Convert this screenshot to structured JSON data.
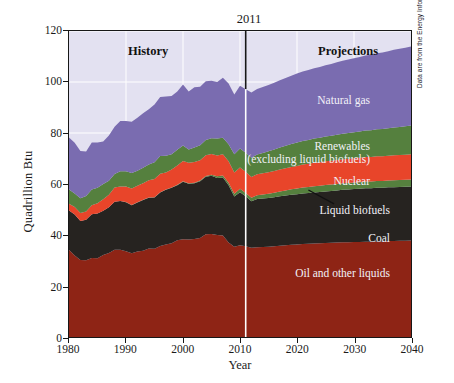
{
  "figure": {
    "background_color": "#ffffff",
    "plot_background_color": "#e3e1f1",
    "gridline_color": "#ffffff",
    "frame_color": "#171717",
    "attribution": "Data are from the Energy Information Administration's Annual Energy Outlook, 2009."
  },
  "axes": {
    "y_title": "Quadrillion Btu",
    "x_title": "Year",
    "y_ticks": [
      0,
      20,
      40,
      60,
      80,
      100,
      120
    ],
    "x_ticks": [
      1980,
      1990,
      2000,
      2010,
      2020,
      2030,
      2040
    ]
  },
  "annotations": {
    "divider_year": "2011",
    "history_label": "History",
    "projections_label": "Projections"
  },
  "chart_data": {
    "type": "area",
    "title": "",
    "subtitle": "",
    "xlabel": "Year",
    "ylabel": "Quadrillion Btu",
    "xlim": [
      1980,
      2040
    ],
    "ylim": [
      0,
      120
    ],
    "grid": true,
    "stacked": true,
    "legend_position": "in-plot labels",
    "divider_x": 2011,
    "annotations": [
      {
        "text": "2011",
        "x": 2011,
        "position": "above-plot"
      },
      {
        "text": "History",
        "x": 1993,
        "y": 112,
        "style": "bold"
      },
      {
        "text": "Projections",
        "x": 2029,
        "y": 112,
        "style": "bold"
      }
    ],
    "x": [
      1980,
      1981,
      1982,
      1983,
      1984,
      1985,
      1986,
      1987,
      1988,
      1989,
      1990,
      1991,
      1992,
      1993,
      1994,
      1995,
      1996,
      1997,
      1998,
      1999,
      2000,
      2001,
      2002,
      2003,
      2004,
      2005,
      2006,
      2007,
      2008,
      2009,
      2010,
      2011,
      2012,
      2013,
      2014,
      2015,
      2016,
      2017,
      2018,
      2019,
      2020,
      2021,
      2022,
      2023,
      2024,
      2025,
      2026,
      2027,
      2028,
      2029,
      2030,
      2031,
      2032,
      2033,
      2034,
      2035,
      2036,
      2037,
      2038,
      2039,
      2040
    ],
    "series": [
      {
        "name": "Oil and other liquids",
        "color": "#8e2415",
        "label_color": "#f2f1f8",
        "values": [
          34.2,
          32.0,
          30.2,
          30.1,
          31.0,
          30.9,
          32.2,
          32.9,
          34.2,
          34.2,
          33.6,
          32.8,
          33.5,
          33.8,
          34.7,
          34.6,
          35.7,
          36.3,
          36.8,
          37.9,
          38.3,
          38.2,
          38.4,
          38.8,
          40.3,
          40.4,
          40.0,
          39.8,
          37.1,
          35.4,
          36.0,
          35.6,
          35.0,
          35.2,
          35.3,
          35.4,
          35.6,
          35.8,
          36.0,
          36.2,
          36.3,
          36.5,
          36.6,
          36.7,
          36.8,
          36.9,
          37.0,
          37.1,
          37.2,
          37.2,
          37.3,
          37.3,
          37.4,
          37.4,
          37.5,
          37.5,
          37.6,
          37.6,
          37.7,
          37.7,
          37.8
        ]
      },
      {
        "name": "Coal",
        "color": "#262320",
        "label_color": "#f2f1f8",
        "values": [
          15.4,
          16.0,
          15.3,
          15.9,
          17.1,
          17.5,
          17.3,
          18.0,
          18.8,
          19.1,
          19.2,
          18.9,
          19.2,
          19.9,
          19.9,
          20.1,
          21.0,
          21.4,
          21.7,
          21.6,
          22.6,
          21.9,
          21.9,
          22.3,
          22.5,
          22.8,
          22.4,
          22.7,
          22.4,
          19.7,
          20.8,
          19.6,
          18.2,
          18.9,
          19.0,
          19.1,
          19.2,
          19.4,
          19.5,
          19.6,
          19.7,
          19.8,
          19.9,
          20.0,
          20.1,
          20.2,
          20.3,
          20.4,
          20.5,
          20.6,
          20.7,
          20.8,
          20.9,
          20.9,
          21.0,
          21.0,
          21.1,
          21.1,
          21.1,
          21.2,
          21.2
        ]
      },
      {
        "name": "Liquid biofuels",
        "color": "#55803e",
        "label_color": "#f2f1f8",
        "values": [
          0.0,
          0.0,
          0.0,
          0.0,
          0.0,
          0.0,
          0.0,
          0.0,
          0.0,
          0.0,
          0.1,
          0.1,
          0.1,
          0.1,
          0.1,
          0.1,
          0.1,
          0.1,
          0.1,
          0.2,
          0.2,
          0.2,
          0.2,
          0.3,
          0.3,
          0.4,
          0.6,
          0.8,
          1.0,
          1.1,
          1.3,
          1.3,
          1.4,
          1.5,
          1.6,
          1.7,
          1.8,
          1.9,
          2.0,
          2.1,
          2.2,
          2.3,
          2.3,
          2.4,
          2.4,
          2.5,
          2.5,
          2.5,
          2.6,
          2.6,
          2.6,
          2.6,
          2.7,
          2.7,
          2.7,
          2.7,
          2.7,
          2.8,
          2.8,
          2.8,
          2.8
        ]
      },
      {
        "name": "Nuclear",
        "color": "#e8452a",
        "label_color": "#f2f1f8",
        "values": [
          2.7,
          3.0,
          3.1,
          3.2,
          3.6,
          4.1,
          4.5,
          4.9,
          5.6,
          5.7,
          6.1,
          6.4,
          6.5,
          6.5,
          6.8,
          7.2,
          7.2,
          6.7,
          7.1,
          7.6,
          7.9,
          8.0,
          8.1,
          7.9,
          8.2,
          8.2,
          8.2,
          8.4,
          8.4,
          8.3,
          8.4,
          8.3,
          8.1,
          8.2,
          8.3,
          8.4,
          8.5,
          8.6,
          8.7,
          8.8,
          8.9,
          9.0,
          9.1,
          9.2,
          9.2,
          9.3,
          9.3,
          9.4,
          9.4,
          9.5,
          9.5,
          9.6,
          9.6,
          9.6,
          9.7,
          9.7,
          9.7,
          9.8,
          9.8,
          9.8,
          9.9
        ]
      },
      {
        "name": "Renewables (excluding liquid biofuels)",
        "color": "#55803e",
        "label_color": "#f2f1f8",
        "values": [
          5.5,
          5.3,
          5.8,
          6.1,
          6.1,
          6.0,
          6.0,
          5.5,
          5.3,
          6.0,
          6.0,
          6.1,
          5.9,
          6.1,
          6.1,
          6.5,
          7.0,
          6.6,
          6.0,
          6.1,
          6.1,
          5.2,
          5.7,
          5.9,
          6.0,
          6.1,
          6.6,
          6.4,
          6.7,
          7.2,
          7.4,
          7.5,
          7.6,
          7.8,
          8.0,
          8.2,
          8.4,
          8.6,
          8.8,
          9.0,
          9.2,
          9.3,
          9.4,
          9.5,
          9.6,
          9.7,
          9.8,
          9.9,
          10.0,
          10.1,
          10.2,
          10.3,
          10.4,
          10.5,
          10.6,
          10.7,
          10.8,
          10.9,
          11.0,
          11.1,
          11.2
        ]
      },
      {
        "name": "Natural gas",
        "color": "#7a6cb0",
        "label_color": "#f2f1f8",
        "values": [
          20.4,
          19.9,
          18.5,
          17.4,
          18.5,
          17.8,
          16.7,
          17.7,
          18.6,
          19.7,
          19.7,
          20.1,
          20.8,
          21.3,
          21.7,
          22.7,
          23.1,
          23.2,
          22.8,
          22.9,
          23.9,
          22.8,
          23.6,
          22.9,
          23.0,
          22.6,
          22.2,
          23.6,
          23.8,
          23.4,
          24.6,
          24.9,
          25.6,
          25.7,
          25.8,
          26.0,
          26.2,
          26.4,
          26.6,
          26.8,
          27.0,
          27.2,
          27.4,
          27.6,
          27.8,
          28.0,
          28.2,
          28.4,
          28.6,
          28.8,
          29.0,
          29.2,
          29.4,
          29.6,
          29.8,
          30.0,
          30.2,
          30.4,
          30.6,
          30.8,
          31.0
        ]
      }
    ],
    "series_labels": [
      {
        "name": "Natural gas",
        "text": "Natural gas"
      },
      {
        "name": "Renewables",
        "text": "Renewables\n(excluding liquid biofuels)"
      },
      {
        "name": "Nuclear",
        "text": "Nuclear"
      },
      {
        "name": "Liquid biofuels",
        "text": "Liquid biofuels"
      },
      {
        "name": "Coal",
        "text": "Coal"
      },
      {
        "name": "Oil and other liquids",
        "text": "Oil and other liquids"
      }
    ]
  },
  "labels": {
    "natural_gas": "Natural gas",
    "renewables_line1": "Renewables",
    "renewables_line2": "(excluding liquid biofuels)",
    "nuclear": "Nuclear",
    "liquid_biofuels": "Liquid biofuels",
    "coal": "Coal",
    "oil": "Oil and other liquids"
  }
}
